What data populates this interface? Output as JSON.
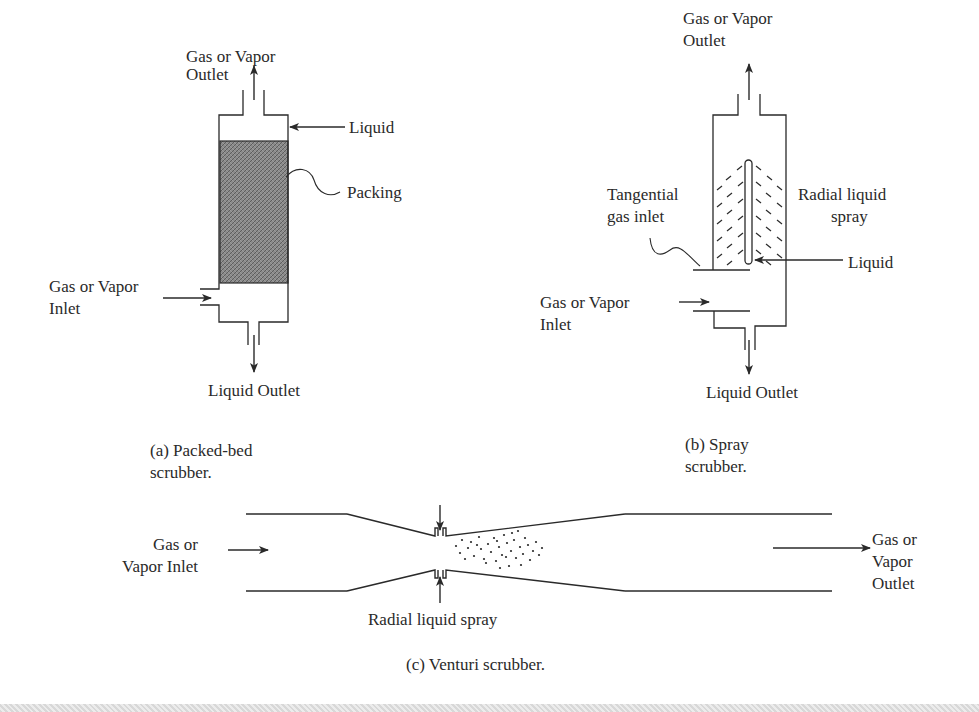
{
  "figure": {
    "panels": [
      {
        "id": "a",
        "caption_line1": "(a) Packed-bed",
        "caption_line2": "scrubber.",
        "labels": {
          "outlet_line1": "Gas or Vapor",
          "outlet_line2": "Outlet",
          "liquid": "Liquid",
          "packing": "Packing",
          "inlet_line1": "Gas or Vapor",
          "inlet_line2": "Inlet",
          "liquid_outlet": "Liquid Outlet"
        },
        "colors": {
          "packing_fill": "#7a7a7a"
        }
      },
      {
        "id": "b",
        "caption_line1": "(b) Spray",
        "caption_line2": "scrubber.",
        "labels": {
          "outlet_line1": "Gas or Vapor",
          "outlet_line2": "Outlet",
          "tangential_line1": "Tangential",
          "tangential_line2": "gas inlet",
          "radial_line1": "Radial liquid",
          "radial_line2": "spray",
          "liquid": "Liquid",
          "inlet_line1": "Gas or Vapor",
          "inlet_line2": "Inlet",
          "liquid_outlet": "Liquid Outlet"
        }
      },
      {
        "id": "c",
        "caption": "(c) Venturi scrubber.",
        "labels": {
          "inlet_line1": "Gas or",
          "inlet_line2": "Vapor Inlet",
          "outlet_line1": "Gas or",
          "outlet_line2": "Vapor",
          "outlet_line3": "Outlet",
          "radial_spray": "Radial liquid spray"
        }
      }
    ],
    "colors": {
      "line": "#2a2a2a",
      "background": "#ffffff"
    }
  }
}
